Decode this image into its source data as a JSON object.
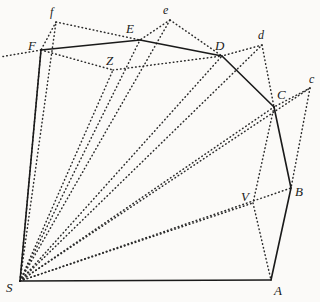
{
  "figure": {
    "background_color": "#fbfaf8",
    "solid_line_color": "#1a1a1a",
    "dotted_line_color": "#2b2b2b"
  },
  "points": {
    "S": {
      "label": "S",
      "x": 20,
      "y": 281,
      "lx": 6,
      "ly": 281
    },
    "A": {
      "label": "A",
      "x": 271,
      "y": 280,
      "lx": 274,
      "ly": 284
    },
    "B": {
      "label": "B",
      "x": 291,
      "y": 188,
      "lx": 295,
      "ly": 185
    },
    "C": {
      "label": "C",
      "x": 274,
      "y": 107,
      "lx": 277,
      "ly": 88
    },
    "D": {
      "label": "D",
      "x": 222,
      "y": 56,
      "lx": 215,
      "ly": 39
    },
    "E": {
      "label": "E",
      "x": 140,
      "y": 40,
      "lx": 126,
      "ly": 22
    },
    "F": {
      "label": "F",
      "x": 41,
      "y": 50,
      "lx": 28,
      "ly": 39
    },
    "Z": {
      "label": "Z",
      "x": 113,
      "y": 70,
      "lx": 106,
      "ly": 54
    },
    "V": {
      "label": "V",
      "x": 253,
      "y": 203,
      "lx": 241,
      "ly": 190
    },
    "c": {
      "label": "c",
      "x": 310,
      "y": 88,
      "lx": 309,
      "ly": 73
    },
    "d": {
      "label": "d",
      "x": 262,
      "y": 45,
      "lx": 258,
      "ly": 29
    },
    "e": {
      "label": "e",
      "x": 170,
      "y": 20,
      "lx": 163,
      "ly": 4
    },
    "f": {
      "label": "f",
      "x": 56,
      "y": 22,
      "lx": 50,
      "ly": 6
    }
  },
  "solid_edges": [
    {
      "name": "edge-S-A",
      "from": "S",
      "to": "A"
    },
    {
      "name": "edge-A-B",
      "from": "A",
      "to": "B"
    },
    {
      "name": "edge-B-C",
      "from": "B",
      "to": "C"
    },
    {
      "name": "edge-C-D",
      "from": "C",
      "to": "D"
    },
    {
      "name": "edge-D-E",
      "from": "D",
      "to": "E"
    },
    {
      "name": "edge-E-F",
      "from": "E",
      "to": "F"
    },
    {
      "name": "edge-F-S",
      "from": "F",
      "to": "S"
    }
  ],
  "dotted_edges": [
    {
      "name": "ray-S-F",
      "from": "S",
      "to": "F"
    },
    {
      "name": "ray-S-f",
      "from": "S",
      "to": "f"
    },
    {
      "name": "ray-S-Z",
      "from": "S",
      "to": "Z"
    },
    {
      "name": "ray-S-E",
      "from": "S",
      "to": "E"
    },
    {
      "name": "ray-S-e",
      "from": "S",
      "to": "e"
    },
    {
      "name": "ray-S-D",
      "from": "S",
      "to": "D"
    },
    {
      "name": "ray-S-d",
      "from": "S",
      "to": "d"
    },
    {
      "name": "ray-S-C",
      "from": "S",
      "to": "C"
    },
    {
      "name": "ray-S-c",
      "from": "S",
      "to": "c"
    },
    {
      "name": "ray-S-V",
      "from": "S",
      "to": "V"
    },
    {
      "name": "ray-S-B",
      "from": "S",
      "to": "B"
    },
    {
      "name": "chord-f-F",
      "from": "f",
      "to": "F"
    },
    {
      "name": "chord-f-E",
      "from": "f",
      "to": "E"
    },
    {
      "name": "chord-e-E",
      "from": "e",
      "to": "E"
    },
    {
      "name": "chord-e-D",
      "from": "e",
      "to": "D"
    },
    {
      "name": "chord-d-D",
      "from": "d",
      "to": "D"
    },
    {
      "name": "chord-d-C",
      "from": "d",
      "to": "C"
    },
    {
      "name": "chord-c-C",
      "from": "c",
      "to": "C"
    },
    {
      "name": "chord-c-B",
      "from": "c",
      "to": "B"
    },
    {
      "name": "chord-F-Z",
      "from": "F",
      "to": "Z"
    },
    {
      "name": "chord-Z-D",
      "from": "Z",
      "to": "D"
    },
    {
      "name": "chord-C-V",
      "from": "C",
      "to": "V"
    },
    {
      "name": "chord-V-A",
      "from": "V",
      "to": "A"
    },
    {
      "name": "tangent-F-left",
      "from": "F",
      "to": "edgeLeft"
    }
  ],
  "labels_order": [
    "f",
    "F",
    "E",
    "e",
    "Z",
    "D",
    "d",
    "C",
    "c",
    "V",
    "B",
    "S",
    "A"
  ]
}
